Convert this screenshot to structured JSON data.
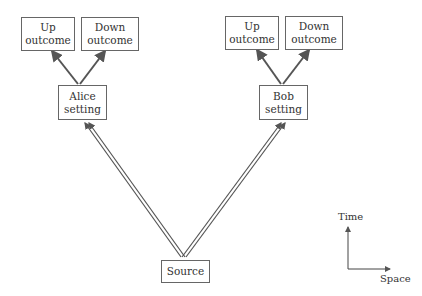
{
  "diagram": {
    "alice": {
      "setting": [
        "Alice",
        "setting"
      ],
      "up": [
        "Up",
        "outcome"
      ],
      "down": [
        "Down",
        "outcome"
      ]
    },
    "bob": {
      "setting": [
        "Bob",
        "setting"
      ],
      "up": [
        "Up",
        "outcome"
      ],
      "down": [
        "Down",
        "outcome"
      ]
    },
    "source": "Source",
    "axes": {
      "time": "Time",
      "space": "Space"
    },
    "colors": {
      "line": "#555555",
      "box_border": "#666666"
    }
  }
}
